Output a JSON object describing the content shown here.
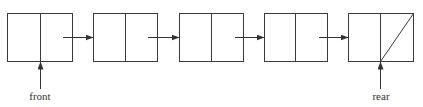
{
  "diagram": {
    "type": "linked-list-queue",
    "stroke_color": "#3a3a3a",
    "nodes": [
      {
        "id": 1,
        "x": 7,
        "y": 13,
        "w": 65,
        "h": 48,
        "divider": 40,
        "null_next": false
      },
      {
        "id": 2,
        "x": 93,
        "y": 13,
        "w": 64,
        "h": 48,
        "divider": 125,
        "null_next": false
      },
      {
        "id": 3,
        "x": 179,
        "y": 13,
        "w": 64,
        "h": 48,
        "divider": 211,
        "null_next": false
      },
      {
        "id": 4,
        "x": 264,
        "y": 13,
        "w": 63,
        "h": 48,
        "divider": 295,
        "null_next": false
      },
      {
        "id": 5,
        "x": 348,
        "y": 13,
        "w": 65,
        "h": 48,
        "divider": 380,
        "null_next": true
      }
    ],
    "links": [
      {
        "from": 1,
        "to": 2,
        "x1": 63,
        "x2": 93,
        "y": 37
      },
      {
        "from": 2,
        "to": 3,
        "x1": 148,
        "x2": 179,
        "y": 37
      },
      {
        "from": 3,
        "to": 4,
        "x1": 235,
        "x2": 264,
        "y": 37
      },
      {
        "from": 4,
        "to": 5,
        "x1": 319,
        "x2": 348,
        "y": 37
      }
    ],
    "pointers": [
      {
        "label": "front",
        "target_node": 1,
        "x": 40,
        "y_from": 90,
        "y_to": 61,
        "label_y": 100
      },
      {
        "label": "rear",
        "target_node": 5,
        "x": 380,
        "y_from": 90,
        "y_to": 61,
        "label_y": 100
      }
    ]
  },
  "labels": {
    "front": "front",
    "rear": "rear"
  }
}
